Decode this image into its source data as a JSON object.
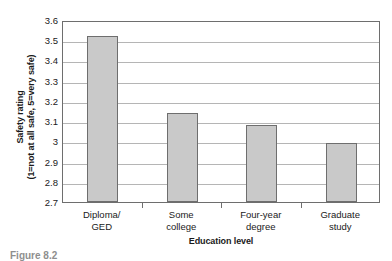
{
  "chart_data": {
    "type": "bar",
    "title": "",
    "categories": [
      "Diploma/ GED",
      "Some college",
      "Four-year degree",
      "Graduate study"
    ],
    "category_lines": [
      [
        "Diploma/",
        "GED"
      ],
      [
        "Some",
        "college"
      ],
      [
        "Four-year",
        "degree"
      ],
      [
        "Graduate",
        "study"
      ]
    ],
    "values": [
      3.52,
      3.14,
      3.08,
      2.99
    ],
    "xlabel": "Education level",
    "ylabel": "Safety rating",
    "ylabel_line2": "(1=not at all safe, 5=very safe)",
    "ylim": [
      2.7,
      3.6
    ],
    "ytick_labels": [
      "3.6",
      "3.5",
      "3.4",
      "3.3",
      "3.2",
      "3.1",
      "3",
      "2.9",
      "2.8",
      "2.7"
    ],
    "ytick_values": [
      3.6,
      3.5,
      3.4,
      3.3,
      3.2,
      3.1,
      3.0,
      2.9,
      2.8,
      2.7
    ],
    "grid": true,
    "legend": false,
    "bar_color": "#c9c9c9",
    "bar_border_color": "#6e6e6e",
    "gridline_color": "#b5b5b5",
    "axis_color": "#6e6e6e"
  },
  "caption": {
    "text": "Figure 8.2"
  }
}
